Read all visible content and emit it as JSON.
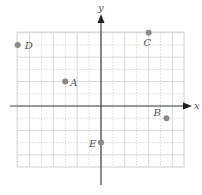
{
  "chart_data": {
    "type": "scatter",
    "title": "",
    "xlabel": "x",
    "ylabel": "y",
    "grid": true,
    "xlim": [
      -7,
      7
    ],
    "ylim": [
      -5,
      6
    ],
    "points": [
      {
        "label": "A",
        "x": -3,
        "y": 2
      },
      {
        "label": "B",
        "x": 5.5,
        "y": -1
      },
      {
        "label": "C",
        "x": 4,
        "y": 6
      },
      {
        "label": "D",
        "x": -7,
        "y": 5
      },
      {
        "label": "E",
        "x": 0,
        "y": -3
      }
    ]
  },
  "axes": {
    "x_label": "x",
    "y_label": "y"
  },
  "colors": {
    "grid": "#d0d0d0",
    "axis": "#444444",
    "point": "#8a8a8a",
    "label": "#555555"
  }
}
